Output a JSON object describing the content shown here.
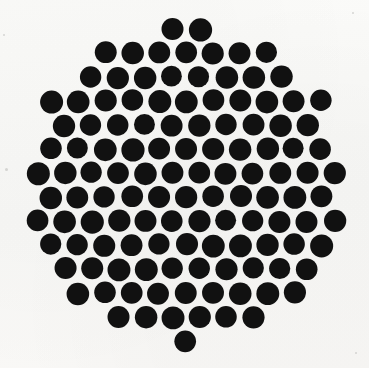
{
  "image": {
    "title": "Hexagonally packed black dot disc",
    "width": 369,
    "height": 368,
    "background_color": "#f9f9f7",
    "dot_color": "#111111",
    "description": "A dense circular arrangement of uniform black dots on an off-white background"
  },
  "pattern": {
    "type": "hexagonal-dot-disc",
    "dot_diameter": 22,
    "dot_radius": 11,
    "column_pitch": 27.0,
    "row_pitch": 24.0,
    "row_offset": 13.5,
    "disc_center_x": 186,
    "disc_center_y": 184,
    "disc_radius": 163,
    "row_count": 14,
    "approx_dot_count": 152,
    "rows": [
      {
        "index": 0,
        "y": 29,
        "offset": 13.5,
        "count": 7
      },
      {
        "index": 1,
        "y": 53,
        "offset": 0,
        "count": 9
      },
      {
        "index": 2,
        "y": 77,
        "offset": 13.5,
        "count": 11
      },
      {
        "index": 3,
        "y": 101,
        "offset": 0,
        "count": 11
      },
      {
        "index": 4,
        "y": 125,
        "offset": 13.5,
        "count": 13
      },
      {
        "index": 5,
        "y": 149,
        "offset": 0,
        "count": 13
      },
      {
        "index": 6,
        "y": 173,
        "offset": 13.5,
        "count": 13
      },
      {
        "index": 7,
        "y": 197,
        "offset": 0,
        "count": 13
      },
      {
        "index": 8,
        "y": 221,
        "offset": 13.5,
        "count": 13
      },
      {
        "index": 9,
        "y": 245,
        "offset": 0,
        "count": 13
      },
      {
        "index": 10,
        "y": 269,
        "offset": 13.5,
        "count": 11
      },
      {
        "index": 11,
        "y": 293,
        "offset": 0,
        "count": 11
      },
      {
        "index": 12,
        "y": 317,
        "offset": 13.5,
        "count": 9
      },
      {
        "index": 13,
        "y": 341,
        "offset": 0,
        "count": 7
      }
    ]
  },
  "artifacts": {
    "specks": [
      {
        "name": "speck-left-mid",
        "x": 5,
        "y": 168,
        "size": 3
      },
      {
        "name": "speck-top-left",
        "x": 3,
        "y": 34,
        "size": 2
      },
      {
        "name": "speck-bottom-right",
        "x": 355,
        "y": 352,
        "size": 2
      },
      {
        "name": "speck-top-right",
        "x": 352,
        "y": 12,
        "size": 2
      }
    ]
  }
}
